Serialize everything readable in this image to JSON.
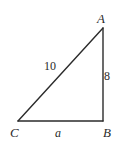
{
  "figure": {
    "kind": "geometry-diagram",
    "shape": "right-triangle",
    "background_color": "#ffffff",
    "stroke_color": "#2b2b2b",
    "text_color": "#2b2b2b",
    "stroke_width": 1.4,
    "right_angle_vertex": "B",
    "vertices": {
      "A": {
        "label": "A",
        "x": 103,
        "y": 28
      },
      "B": {
        "label": "B",
        "x": 103,
        "y": 121
      },
      "C": {
        "label": "C",
        "x": 18,
        "y": 121
      }
    },
    "sides": [
      {
        "name": "hypotenuse",
        "from": "C",
        "to": "A",
        "label": "10",
        "label_style": "roman"
      },
      {
        "name": "vertical-leg",
        "from": "A",
        "to": "B",
        "label": "8",
        "label_style": "roman"
      },
      {
        "name": "base-leg",
        "from": "C",
        "to": "B",
        "label": "a",
        "label_style": "italic"
      }
    ]
  },
  "chart_data": {
    "type": "diagram",
    "title": "",
    "points": [
      {
        "name": "A",
        "x": 103,
        "y": 28
      },
      {
        "name": "B",
        "x": 103,
        "y": 121
      },
      {
        "name": "C",
        "x": 18,
        "y": 121
      }
    ],
    "edges": [
      {
        "from": "C",
        "to": "A",
        "label": "10"
      },
      {
        "from": "A",
        "to": "B",
        "label": "8"
      },
      {
        "from": "C",
        "to": "B",
        "label": "a"
      }
    ],
    "annotations": [
      "10",
      "8",
      "a",
      "A",
      "B",
      "C"
    ]
  }
}
